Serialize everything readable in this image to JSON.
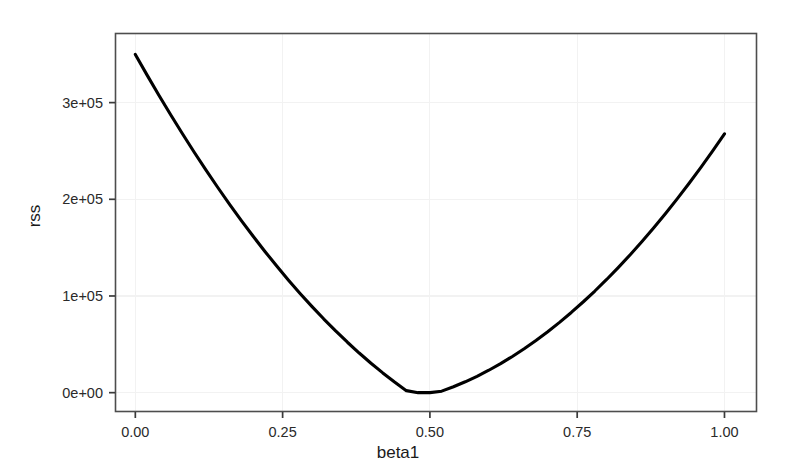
{
  "chart_data": {
    "type": "line",
    "title": "",
    "xlabel": "beta1",
    "ylabel": "rss",
    "xlim": [
      -0.0345,
      1.0552
    ],
    "ylim": [
      -20000,
      372000
    ],
    "grid": true,
    "legend": null,
    "curve_color": "#000000",
    "panel_background": "#ffffff",
    "panel_border_color": "#4d4d4d",
    "gridline_color": "#f2f2f2",
    "x_ticks": [
      "0.00",
      "0.25",
      "0.50",
      "0.75",
      "1.00"
    ],
    "x_tick_values": [
      0,
      0.25,
      0.5,
      0.75,
      1.0
    ],
    "y_ticks": [
      "0e+00",
      "1e+05",
      "2e+05",
      "3e+05"
    ],
    "y_tick_values": [
      0,
      100000,
      200000,
      300000
    ],
    "series": [
      {
        "name": "rss",
        "x": [
          0.0,
          0.02,
          0.04,
          0.06,
          0.08,
          0.1,
          0.12,
          0.14,
          0.16,
          0.18,
          0.2,
          0.22,
          0.24,
          0.26,
          0.28,
          0.3,
          0.32,
          0.34,
          0.36,
          0.38,
          0.4,
          0.42,
          0.44,
          0.46,
          0.48,
          0.5,
          0.52,
          0.54,
          0.56,
          0.58,
          0.6,
          0.62,
          0.64,
          0.66,
          0.68,
          0.7,
          0.72,
          0.74,
          0.76,
          0.78,
          0.8,
          0.82,
          0.84,
          0.86,
          0.88,
          0.9,
          0.92,
          0.94,
          0.96,
          0.98,
          1.0
        ],
        "y": [
          349798,
          328438,
          307646,
          287421,
          267764,
          248674,
          230152,
          212197,
          194810,
          177990,
          161738,
          146053,
          130936,
          116386,
          102404,
          88989,
          76142,
          63862,
          52150,
          41005,
          30428,
          20418,
          10976,
          2101,
          0,
          0,
          1544,
          6106,
          11236,
          16934,
          23200,
          30034,
          37435,
          45405,
          53942,
          63047,
          72720,
          82960,
          93768,
          105144,
          117088,
          129600,
          142679,
          156326,
          170541,
          185324,
          200674,
          216592,
          233078,
          250132,
          267754
        ],
        "formula_note": "rss = 853500 * (beta1 - 0.64)^2"
      }
    ],
    "curve_minimum": {
      "x": 0.64,
      "y": 0
    },
    "curve_endpoints": {
      "left": {
        "x": 0.0,
        "y": 349600
      },
      "right": {
        "x": 1.0,
        "y": 110600
      }
    }
  },
  "plot_geometry": {
    "panel_left": 115,
    "panel_top": 33,
    "panel_right": 757,
    "panel_bottom": 412,
    "x0_px": 145,
    "x1_px": 725,
    "y0_px": 392,
    "y_per_1e5_px": 97.3
  }
}
